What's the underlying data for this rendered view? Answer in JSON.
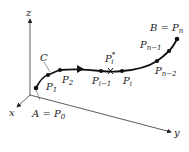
{
  "diagram": {
    "axes": {
      "x": "x",
      "y": "y",
      "z": "z"
    },
    "curve_label": "C",
    "points": {
      "A": "A = P",
      "A_sub": "0",
      "P1": "P",
      "P1_sub": "1",
      "P2": "P",
      "P2_sub": "2",
      "Pim1": "P",
      "Pim1_sub": "i−1",
      "Pstar": "P",
      "Pstar_sub": "i",
      "Pstar_sup": "*",
      "Pi": "P",
      "Pi_sub": "i",
      "Pnm2": "P",
      "Pnm2_sub": "n−2",
      "Pnm1": "P",
      "Pnm1_sub": "n−1",
      "B": "B = P",
      "B_sub": "n"
    }
  }
}
